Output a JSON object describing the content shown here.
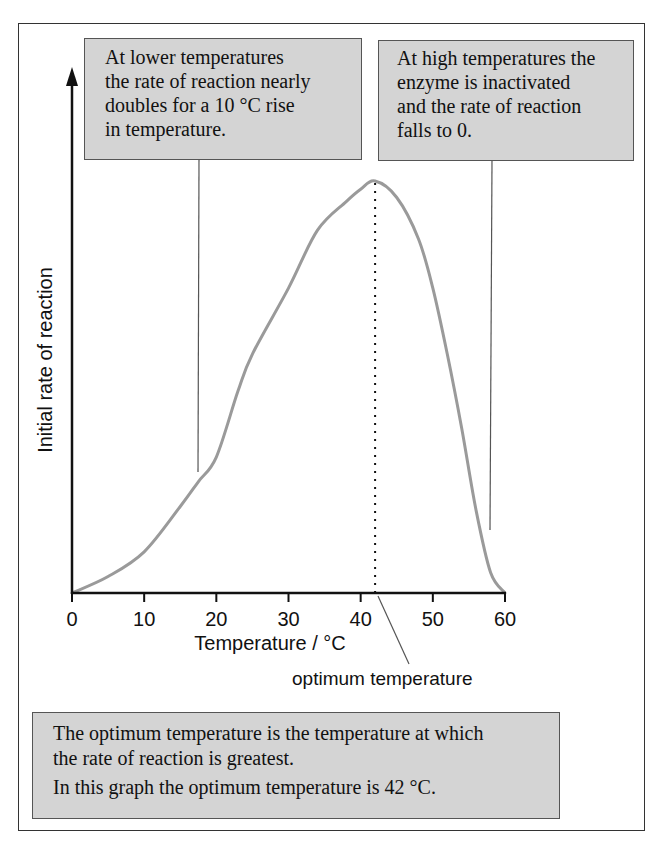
{
  "chart_data": {
    "type": "line",
    "title": "",
    "xlabel": "Temperature / °C",
    "ylabel": "Initial rate of reaction",
    "xlim": [
      0,
      60
    ],
    "ylim": [
      0,
      100
    ],
    "x_ticks": [
      "0",
      "10",
      "20",
      "30",
      "40",
      "50",
      "60"
    ],
    "y_ticks": [],
    "grid": false,
    "legend": null,
    "series": [
      {
        "name": "Initial rate of reaction",
        "color": "#9a9a9a",
        "x": [
          0,
          5,
          10,
          15,
          17.5,
          20,
          23,
          25,
          30,
          34,
          38,
          40,
          42,
          45,
          48,
          50,
          52,
          54,
          56,
          58,
          60
        ],
        "y": [
          0,
          4,
          10,
          21,
          27,
          33,
          49,
          58,
          74,
          88,
          95,
          98,
          100,
          96,
          86,
          74,
          58,
          40,
          20,
          5,
          0
        ],
        "units": "relative (peak = 100)"
      }
    ],
    "optimum": {
      "x": 42,
      "y": 100
    },
    "annotations": [
      {
        "label": "optimum temperature",
        "target_x": 42
      },
      {
        "label": "At lower temperatures the rate of reaction nearly doubles for a 10 °C rise in temperature.",
        "target_x": 17.5
      },
      {
        "label": "At high temperatures the enzyme is inactivated and the rate of reaction falls to 0.",
        "target_x": 58
      }
    ]
  },
  "notes": {
    "low_temp": {
      "lines": [
        "At lower temperatures",
        "the rate of reaction nearly",
        "doubles for a 10 °C rise",
        "in temperature."
      ]
    },
    "high_temp": {
      "lines": [
        "At high temperatures the",
        "enzyme is inactivated",
        "and the rate of reaction",
        "falls to 0."
      ]
    },
    "optimum_def": {
      "lines": [
        "The optimum temperature is the temperature at which",
        "the rate of reaction is greatest.",
        "In this graph the optimum temperature is 42 °C."
      ]
    }
  },
  "axes": {
    "x_label": "Temperature / °C",
    "y_label": "Initial rate of reaction",
    "x_ticks": [
      "0",
      "10",
      "20",
      "30",
      "40",
      "50",
      "60"
    ]
  },
  "callout": {
    "optimum_label": "optimum temperature"
  },
  "colors": {
    "curve": "#9a9a9a",
    "axis": "#111111",
    "note_fill": "#d4d4d4",
    "note_border": "#555555",
    "leader": "#555555"
  }
}
